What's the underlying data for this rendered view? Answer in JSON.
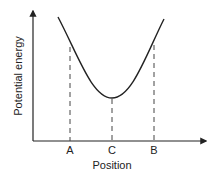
{
  "diagram": {
    "x_axis_label": "Position",
    "y_axis_label": "Potential energy",
    "points": [
      {
        "label": "A",
        "x": 70
      },
      {
        "label": "C",
        "x": 112
      },
      {
        "label": "B",
        "x": 154
      }
    ],
    "curve": "U-shaped potential energy well with minimum at C",
    "colors": {
      "line": "#222222",
      "background": "#ffffff"
    }
  }
}
